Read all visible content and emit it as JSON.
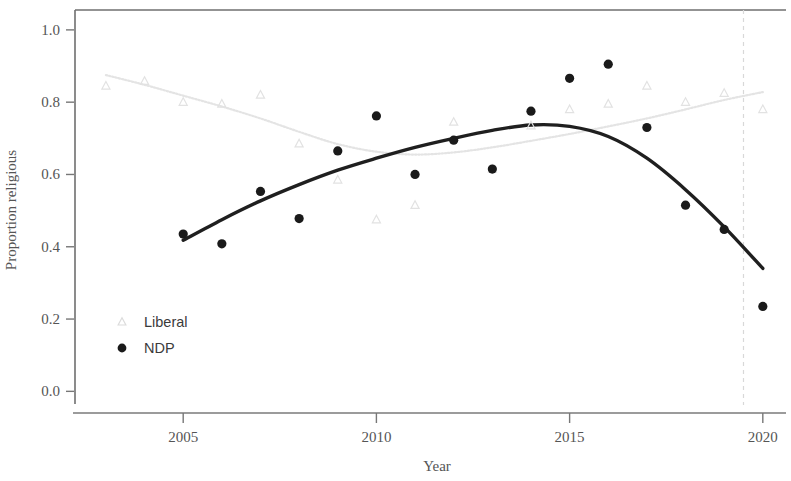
{
  "chart_data": {
    "type": "scatter",
    "title": "",
    "xlabel": "Year",
    "ylabel": "Proportion religious",
    "xlim": [
      2002.2,
      2020.6
    ],
    "ylim": [
      -0.035,
      1.055
    ],
    "xticks": [
      2005,
      2010,
      2015,
      2020
    ],
    "xtick_labels": [
      "2005",
      "2010",
      "2015",
      "2020"
    ],
    "yticks": [
      0.0,
      0.2,
      0.4,
      0.6,
      0.8,
      1.0
    ],
    "ytick_labels": [
      "0.0",
      "0.2",
      "0.4",
      "0.6",
      "0.8",
      "1.0"
    ],
    "grid": false,
    "legend_position": "bottom-left",
    "annotations": [
      {
        "name": "vertical-reference-line",
        "type": "vline",
        "x": 2019.5,
        "style": "dashed",
        "color": "#d8d8d8"
      }
    ],
    "series": [
      {
        "name": "Liberal",
        "marker": "triangle",
        "color": "#e2e2e2",
        "line_style": "dotted",
        "x": [
          2003,
          2004,
          2005,
          2006,
          2007,
          2008,
          2009,
          2010,
          2011,
          2012,
          2013,
          2014,
          2015,
          2016,
          2017,
          2018,
          2019,
          2020
        ],
        "values": [
          0.845,
          0.858,
          0.8,
          0.795,
          0.82,
          0.685,
          0.585,
          0.475,
          0.515,
          0.745,
          0.615,
          0.735,
          0.78,
          0.795,
          0.845,
          0.8,
          0.825,
          0.78
        ],
        "trend_x": [
          2003,
          2004,
          2005,
          2006,
          2007,
          2008,
          2009,
          2010,
          2011,
          2012,
          2013,
          2014,
          2015,
          2016,
          2017,
          2018,
          2019,
          2020
        ],
        "trend_y": [
          0.875,
          0.848,
          0.818,
          0.788,
          0.755,
          0.718,
          0.684,
          0.663,
          0.655,
          0.661,
          0.675,
          0.693,
          0.712,
          0.733,
          0.755,
          0.78,
          0.806,
          0.828
        ]
      },
      {
        "name": "NDP",
        "marker": "circle",
        "color": "#1a1a1a",
        "line_style": "solid",
        "x": [
          2005,
          2006,
          2007,
          2008,
          2009,
          2010,
          2011,
          2012,
          2013,
          2014,
          2015,
          2016,
          2017,
          2018,
          2019,
          2020
        ],
        "values": [
          0.435,
          0.408,
          0.553,
          0.478,
          0.665,
          0.762,
          0.6,
          0.695,
          0.615,
          0.775,
          0.866,
          0.905,
          0.73,
          0.515,
          0.448,
          0.235
        ],
        "trend_x": [
          2005,
          2006,
          2007,
          2008,
          2009,
          2010,
          2011,
          2012,
          2013,
          2014,
          2015,
          2016,
          2017,
          2018,
          2019,
          2020
        ],
        "trend_y": [
          0.418,
          0.475,
          0.527,
          0.572,
          0.612,
          0.645,
          0.675,
          0.7,
          0.722,
          0.737,
          0.733,
          0.705,
          0.645,
          0.558,
          0.455,
          0.34
        ]
      }
    ]
  },
  "legend": {
    "items": [
      {
        "label": "Liberal",
        "marker": "triangle",
        "color": "#dcdcdc"
      },
      {
        "label": "NDP",
        "marker": "circle",
        "color": "#1a1a1a"
      }
    ]
  },
  "axes": {
    "x_title": "Year",
    "y_title": "Proportion religious"
  }
}
